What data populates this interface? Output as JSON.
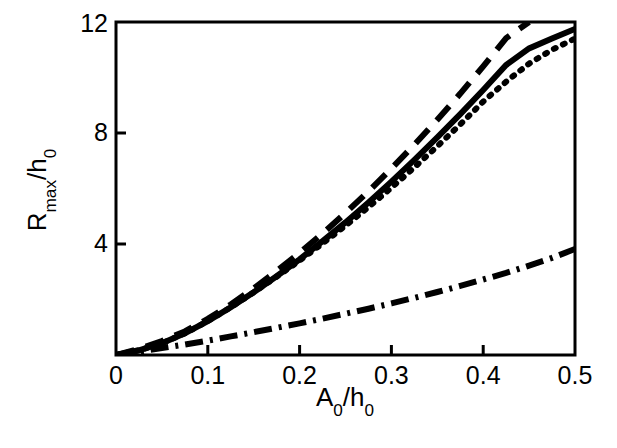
{
  "figure": {
    "background_color": "#ffffff",
    "line_color": "#000000",
    "width": 617,
    "height": 448
  },
  "axes": {
    "x_title_main": "A",
    "x_title_sub1": "0",
    "x_title_mid": "/h",
    "x_title_sub2": "0",
    "y_title_main": "R",
    "y_title_sub1": "max",
    "y_title_mid": "/h",
    "y_title_sub2": "0",
    "x_ticks": [
      "0",
      "0.1",
      "0.2",
      "0.3",
      "0.4",
      "0.5"
    ],
    "y_ticks": [
      "4",
      "8",
      "12"
    ]
  },
  "chart_data": {
    "type": "line",
    "title": "",
    "subtitle": "",
    "xlabel": "A_0/h_0",
    "ylabel": "R_max/h_0",
    "xlim": [
      0,
      0.5
    ],
    "ylim": [
      0,
      12
    ],
    "xticks": [
      0,
      0.1,
      0.2,
      0.3,
      0.4,
      0.5
    ],
    "yticks": [
      0,
      4,
      8,
      12
    ],
    "grid": false,
    "legend": "none",
    "x": [
      0,
      0.025,
      0.05,
      0.075,
      0.1,
      0.125,
      0.15,
      0.175,
      0.2,
      0.225,
      0.25,
      0.275,
      0.3,
      0.325,
      0.35,
      0.375,
      0.4,
      0.425,
      0.45,
      0.475,
      0.5
    ],
    "series": [
      {
        "name": "dashed",
        "style": "dashed",
        "color": "#000000",
        "values": [
          0,
          0.22,
          0.5,
          0.85,
          1.3,
          1.82,
          2.4,
          3.02,
          3.68,
          4.38,
          5.12,
          5.9,
          6.72,
          7.58,
          8.48,
          9.42,
          10.4,
          11.42,
          12.0,
          null,
          null
        ],
        "note": "exits top of axes at x≈0.44, y=12"
      },
      {
        "name": "solid",
        "style": "solid",
        "color": "#000000",
        "values": [
          0,
          0.17,
          0.42,
          0.78,
          1.22,
          1.72,
          2.26,
          2.84,
          3.45,
          4.1,
          4.78,
          5.5,
          6.25,
          7.03,
          7.84,
          8.68,
          9.55,
          10.45,
          11.05,
          11.4,
          11.75
        ]
      },
      {
        "name": "dotted",
        "style": "dotted",
        "color": "#000000",
        "values": [
          0,
          0.17,
          0.42,
          0.78,
          1.22,
          1.72,
          2.26,
          2.82,
          3.4,
          4.02,
          4.66,
          5.33,
          6.03,
          6.76,
          7.52,
          8.31,
          9.13,
          9.85,
          10.5,
          11.0,
          11.4
        ]
      },
      {
        "name": "dash-dot",
        "style": "dash-dot",
        "color": "#000000",
        "values": [
          0,
          0.12,
          0.25,
          0.38,
          0.52,
          0.67,
          0.82,
          0.98,
          1.14,
          1.31,
          1.49,
          1.67,
          1.86,
          2.06,
          2.27,
          2.49,
          2.72,
          2.96,
          3.22,
          3.5,
          3.82
        ]
      }
    ]
  }
}
